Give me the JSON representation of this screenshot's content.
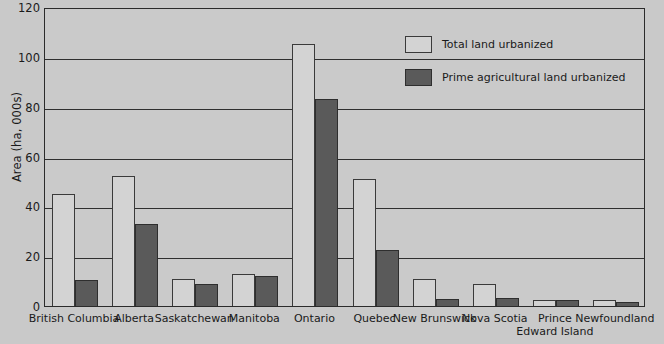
{
  "chart_data": {
    "type": "bar",
    "title": "",
    "xlabel": "",
    "ylabel": "Area (ha, 000s)",
    "ylim": [
      0,
      120
    ],
    "yticks": [
      0,
      20,
      40,
      60,
      80,
      100,
      120
    ],
    "grid": true,
    "legend_position": "top-right",
    "categories": [
      "British Columbia",
      "Alberta",
      "Saskatchewan",
      "Manitoba",
      "Ontario",
      "Quebec",
      "New Brunswick",
      "Nova Scotia",
      "Prince\nEdward Island",
      "Newfoundland"
    ],
    "series": [
      {
        "name": "Total land urbanized",
        "color": "#d3d3d3",
        "values": [
          45,
          52,
          11,
          13,
          105,
          51,
          11,
          9,
          2.5,
          2.5
        ]
      },
      {
        "name": "Prime agricultural land urbanized",
        "color": "#5a5a5a",
        "values": [
          10.5,
          33,
          9,
          12,
          83,
          22.5,
          3,
          3.2,
          2.3,
          1.5
        ]
      }
    ]
  },
  "legend": {
    "items": [
      {
        "label": "Total land urbanized",
        "swatch": "total"
      },
      {
        "label": "Prime agricultural land urbanized",
        "swatch": "prime"
      }
    ]
  },
  "axis": {
    "y_title": "Area (ha, 000s)",
    "y_tick_labels": [
      "0",
      "20",
      "40",
      "60",
      "80",
      "100",
      "120"
    ]
  },
  "colors": {
    "background": "#c9c9c9",
    "plot_background": "#cacaca",
    "total_bar": "#d3d3d3",
    "prime_bar": "#5a5a5a",
    "axis_line": "#2b2b2b",
    "text": "#1a1a1a"
  }
}
